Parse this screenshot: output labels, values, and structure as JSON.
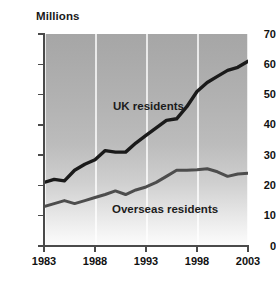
{
  "chart_data": {
    "type": "line",
    "title": "",
    "subtitle": "",
    "unit_label": "Millions",
    "xlabel": "",
    "ylabel": "Millions",
    "xlim": [
      1983,
      2003
    ],
    "ylim": [
      0,
      70
    ],
    "grid": "vertical gridlines at 1983, 1988, 1993, 1998, 2003",
    "legend_position": "inline-annotation",
    "y_ticks": [
      0,
      10,
      20,
      30,
      40,
      50,
      60,
      70
    ],
    "y_tick_labels": [
      "0",
      "10",
      "20",
      "30",
      "40",
      "50",
      "60",
      "70"
    ],
    "x_ticks": [
      1983,
      1988,
      1993,
      1998,
      2003
    ],
    "x_tick_labels": [
      "1983",
      "1988",
      "1993",
      "1998",
      "2003"
    ],
    "x": [
      1983,
      1984,
      1985,
      1986,
      1987,
      1988,
      1989,
      1990,
      1991,
      1992,
      1993,
      1994,
      1995,
      1996,
      1997,
      1998,
      1999,
      2000,
      2001,
      2002,
      2003
    ],
    "series": [
      {
        "name": "UK residents",
        "color": "#1a1a1a",
        "values": [
          21,
          22,
          21.5,
          25,
          27,
          28.5,
          31.5,
          31,
          31,
          34,
          36.5,
          39,
          41.5,
          42,
          46,
          51,
          54,
          56,
          58,
          59,
          61
        ]
      },
      {
        "name": "Overseas residents",
        "color": "#4d4d4d",
        "values": [
          13,
          14,
          15,
          14,
          15,
          16,
          17,
          18.2,
          17,
          18.5,
          19.5,
          21,
          23,
          25,
          25,
          25.2,
          25.5,
          24.5,
          23,
          23.8,
          24
        ]
      }
    ],
    "annotations": [
      {
        "id": "uk",
        "text": "UK residents"
      },
      {
        "id": "overseas",
        "text": "Overseas residents"
      }
    ],
    "caption": ""
  },
  "chart": {
    "unit_label": "Millions",
    "uk_label": "UK residents",
    "overseas_label": "Overseas residents"
  }
}
